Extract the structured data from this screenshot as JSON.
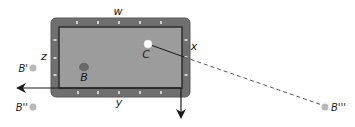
{
  "diagram": {
    "colors": {
      "rail": "#6f6f6f",
      "rail_edge": "#5a5a5a",
      "felt": "#9c9c9c",
      "felt_border": "#2e2e2e",
      "sight": "#e6e6e6",
      "ball_b": "#6a6a6a",
      "ball_c": "#ffffff",
      "ghost_ball": "#b8b8b8",
      "axis_line": "#1a1a1a",
      "path_line": "#1a1a1a",
      "dashed_line": "#555555"
    },
    "table": {
      "outer": {
        "x": 51,
        "y": 18,
        "w": 139,
        "h": 79,
        "r": 5
      },
      "felt": {
        "x": 59,
        "y": 27,
        "w": 123,
        "h": 61
      },
      "sights_top": [
        77,
        98,
        119,
        140,
        161
      ],
      "sights_bottom": [
        78,
        98,
        119,
        140,
        161
      ],
      "sights_left": [
        40,
        58,
        75
      ],
      "sights_right": [
        40,
        57,
        75
      ]
    },
    "side_labels": {
      "top": "w",
      "right": "x",
      "bottom": "y",
      "left": "z"
    },
    "balls": [
      {
        "id": "B",
        "label": "B",
        "x": 84,
        "y": 67,
        "type": "object"
      },
      {
        "id": "C",
        "label": "C",
        "x": 148,
        "y": 44,
        "type": "cue"
      }
    ],
    "reflections": [
      {
        "id": "B-prime",
        "label": "B'",
        "x": 33,
        "y": 68
      },
      {
        "id": "B-double-prime",
        "label": "B''",
        "x": 33,
        "y": 107
      },
      {
        "id": "B-triple-prime",
        "label": "B'''",
        "x": 325,
        "y": 107
      }
    ],
    "axes": {
      "horizontal_arrow": {
        "from": [
          181,
          88
        ],
        "to": [
          12,
          88
        ],
        "direction": "left"
      },
      "vertical_arrow": {
        "from": [
          181,
          88
        ],
        "to": [
          181,
          123
        ],
        "direction": "down"
      }
    },
    "paths": {
      "solid": {
        "from": [
          148,
          44
        ],
        "to": [
          184,
          57
        ]
      },
      "dashed": {
        "from": [
          184,
          57
        ],
        "to": [
          322,
          105
        ]
      }
    }
  }
}
